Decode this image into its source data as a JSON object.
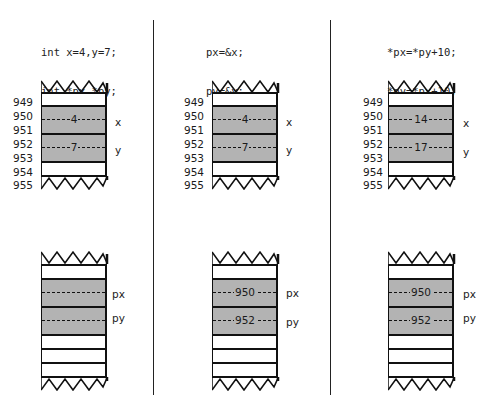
{
  "panels": [
    {
      "code": [
        "int x=4,y=7;",
        "int *px,*py;"
      ],
      "addresses": [
        "949",
        "950",
        "951",
        "952",
        "953",
        "954",
        "955"
      ],
      "vars_top": [
        {
          "label": "x",
          "value": "4"
        },
        {
          "label": "y",
          "value": "7"
        }
      ],
      "vars_bottom": [
        {
          "label": "px",
          "value": ""
        },
        {
          "label": "py",
          "value": ""
        }
      ]
    },
    {
      "code": [
        "px=&x;",
        "py=&y;"
      ],
      "addresses": [
        "949",
        "950",
        "951",
        "952",
        "953",
        "954",
        "955"
      ],
      "vars_top": [
        {
          "label": "x",
          "value": "4"
        },
        {
          "label": "y",
          "value": "7"
        }
      ],
      "vars_bottom": [
        {
          "label": "px",
          "value": "950"
        },
        {
          "label": "py",
          "value": "952"
        }
      ]
    },
    {
      "code": [
        "*px=*py+10;",
        "*py=*px+10;"
      ],
      "addresses": [
        "949",
        "950",
        "951",
        "952",
        "953",
        "954",
        "955"
      ],
      "vars_top": [
        {
          "label": "x",
          "value": "14"
        },
        {
          "label": "y",
          "value": "17"
        }
      ],
      "vars_bottom": [
        {
          "label": "px",
          "value": "950"
        },
        {
          "label": "py",
          "value": "952"
        }
      ]
    }
  ],
  "colors": {
    "filled_cell": "#b3b3b3",
    "empty_cell": "#ffffff",
    "line": "#111111"
  }
}
